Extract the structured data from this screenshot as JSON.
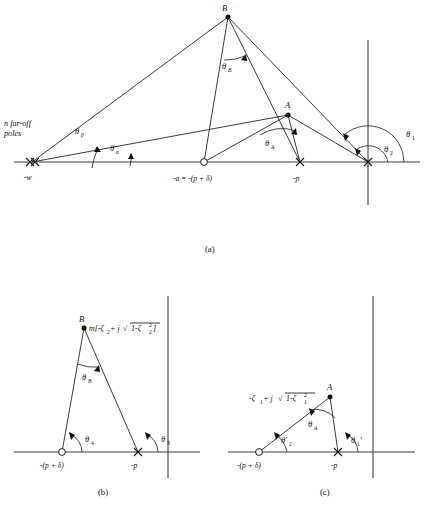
{
  "figure": {
    "background_color": "#ffffff",
    "line_color": "#1a1a1a",
    "axis_color": "#3d3d3d"
  },
  "panel_a": {
    "caption": "(a)",
    "note_line1": "n far-off",
    "note_line2": "poles",
    "point_b_label": "B",
    "point_a_label": "A",
    "theta_beta": "θ",
    "theta_beta_sub": "β",
    "theta_alpha": "θ",
    "theta_alpha_sub": "α",
    "theta_b": "θ",
    "theta_b_sub": "B",
    "theta_a": "θ",
    "theta_a_sub": "A",
    "theta_1": "θ",
    "theta_1_sub": "1",
    "theta_2": "θ",
    "theta_2_sub": "2",
    "label_minus_w": "-w",
    "label_zero": "-a = -(p + δ)",
    "label_minus_p": "-p"
  },
  "panel_b": {
    "caption": "(b)",
    "point_b_label": "B",
    "b_expression": "m[-ζ",
    "b_expression_sub": "2",
    "b_expression_mid": " + j",
    "b_radical_pre": "1-ζ",
    "b_radical_sub": "2",
    "b_radical_sup": "2",
    "b_expression_end": "]",
    "theta_b": "θ",
    "theta_b_sub": "B",
    "theta_4": "θ",
    "theta_4_sub": "4",
    "theta_3": "θ",
    "theta_3_sub": "3",
    "label_zero": "-(p + δ)",
    "label_minus_p": "-p"
  },
  "panel_c": {
    "caption": "(c)",
    "point_a_label": "A",
    "a_expression": "-ζ",
    "a_expression_sub": "1",
    "a_expression_mid": " + j",
    "a_radical_pre": "1-ζ",
    "a_radical_sub": "1",
    "a_radical_sup": "2",
    "theta_a": "θ",
    "theta_a_sub": "A",
    "theta_2_prime": "θ'",
    "theta_2_prime_sub": "2",
    "theta_1_prime": "θ",
    "theta_1_prime_sub": "1",
    "theta_1_prime_mark": "'",
    "label_zero": "-(p + δ)",
    "label_minus_p": "-p"
  }
}
